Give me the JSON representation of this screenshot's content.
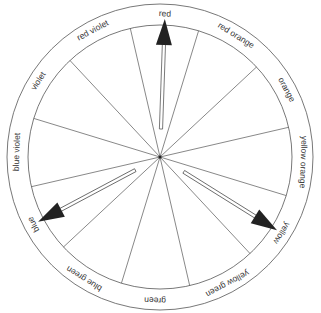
{
  "diagram": {
    "segments": [
      {
        "label": "red",
        "angle": 0
      },
      {
        "label": "red orange",
        "angle": 30
      },
      {
        "label": "orange",
        "angle": 60
      },
      {
        "label": "yellow orange",
        "angle": 90
      },
      {
        "label": "yellow",
        "angle": 120
      },
      {
        "label": "yellow green",
        "angle": 150
      },
      {
        "label": "green",
        "angle": 180
      },
      {
        "label": "blue green",
        "angle": 210
      },
      {
        "label": "blue",
        "angle": 240
      },
      {
        "label": "blue violet",
        "angle": 270
      },
      {
        "label": "violet",
        "angle": 300
      },
      {
        "label": "red violet",
        "angle": 330
      }
    ],
    "arrows": [
      {
        "points_to": "red",
        "angle": 0
      },
      {
        "points_to": "yellow",
        "angle": 120
      },
      {
        "points_to": "blue",
        "angle": 240
      }
    ],
    "colors": {
      "line": "#555555",
      "arrow_fill": "#222222",
      "text": "#333333",
      "background": "#ffffff"
    }
  }
}
